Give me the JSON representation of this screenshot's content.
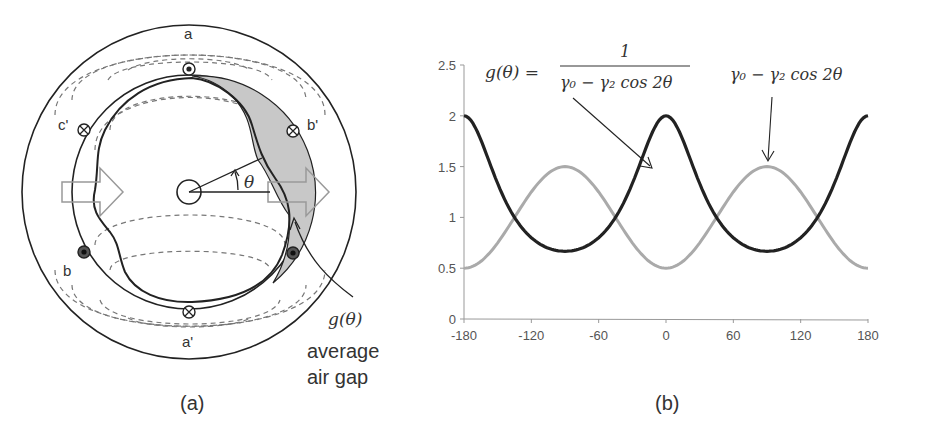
{
  "panel_a": {
    "caption": "(a)",
    "labels": {
      "a": "a",
      "a_prime": "a'",
      "b": "b",
      "b_prime": "b'",
      "c_prime": "c'",
      "theta": "θ",
      "gap_func": "g(θ)",
      "gap_text_line1": "average",
      "gap_text_line2": "air gap"
    },
    "colors": {
      "gap_fill": "#c8c8c8",
      "stroke": "#222222",
      "field_lines": "#777777",
      "arrow": "#999999"
    }
  },
  "panel_b": {
    "caption": "(b)",
    "annotations": {
      "g_lhs": "g(θ) =",
      "g_num": "1",
      "g_den": "γ₀ − γ₂ cos 2θ",
      "perm": "γ₀ − γ₂ cos 2θ"
    },
    "colors": {
      "g_series": "#222222",
      "perm_series": "#aaaaaa"
    }
  },
  "chart_data": {
    "type": "line",
    "title": "",
    "xlabel": "",
    "ylabel": "",
    "xlim": [
      -180,
      180
    ],
    "ylim": [
      0,
      2.5
    ],
    "xticks": [
      -180,
      -120,
      -60,
      0,
      60,
      120,
      180
    ],
    "yticks": [
      0,
      0.5,
      1,
      1.5,
      2,
      2.5
    ],
    "xtick_labels": [
      "-180",
      "-120",
      "-60",
      "0",
      "60",
      "120",
      "180"
    ],
    "ytick_labels": [
      "0",
      "0.5",
      "1",
      "1.5",
      "2",
      "2.5"
    ],
    "grid": false,
    "legend": "none (inline annotations)",
    "x": [
      -180,
      -150,
      -120,
      -90,
      -60,
      -30,
      0,
      30,
      60,
      90,
      120,
      150,
      180
    ],
    "series": [
      {
        "name": "g(θ) = 1/(γ0 − γ2 cos 2θ)",
        "color": "#222222",
        "values": [
          2.0,
          1.33,
          0.8,
          0.667,
          0.8,
          1.33,
          2.0,
          1.33,
          0.8,
          0.667,
          0.8,
          1.33,
          2.0
        ]
      },
      {
        "name": "γ0 − γ2 cos 2θ",
        "color": "#aaaaaa",
        "values": [
          0.5,
          0.75,
          1.25,
          1.5,
          1.25,
          0.75,
          0.5,
          0.75,
          1.25,
          1.5,
          1.25,
          0.75,
          0.5
        ]
      }
    ],
    "parameters": {
      "gamma0": 1.0,
      "gamma2": 0.5
    }
  }
}
